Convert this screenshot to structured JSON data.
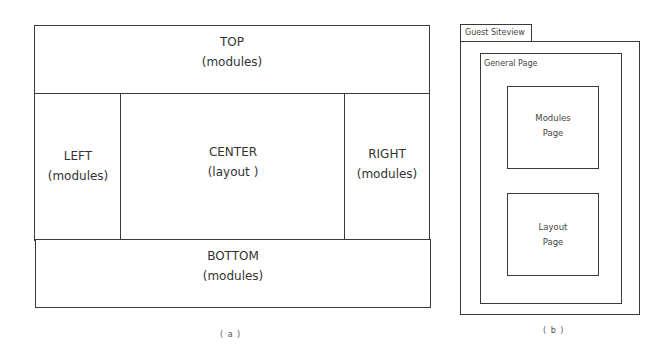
{
  "figure_a": {
    "top": {
      "title": "TOP",
      "subtitle": "(modules)"
    },
    "left": {
      "title": "LEFT",
      "subtitle": "(modules)"
    },
    "center": {
      "title": "CENTER",
      "subtitle": "(layout )"
    },
    "right": {
      "title": "RIGHT",
      "subtitle": "(modules)"
    },
    "bottom": {
      "title": "BOTTOM",
      "subtitle": "(modules)"
    },
    "caption": "( a )"
  },
  "figure_b": {
    "tab_label": "Guest Siteview",
    "general_page_label": "General Page",
    "modules_page": {
      "line1": "Modules",
      "line2": "Page"
    },
    "layout_page": {
      "line1": "Layout",
      "line2": "Page"
    },
    "caption": "( b )"
  }
}
